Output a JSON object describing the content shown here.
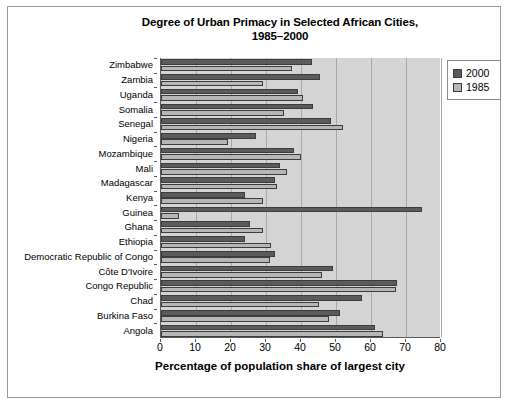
{
  "chart_data": {
    "type": "bar",
    "orientation": "horizontal",
    "title": "Degree of Urban Primacy in Selected African Cities, 1985–2000",
    "title_line1": "Degree of Urban Primacy in Selected African Cities,",
    "title_line2": "1985–2000",
    "xlabel": "Percentage of population share of largest city",
    "ylabel": "",
    "xlim": [
      0,
      80
    ],
    "xticks": [
      0,
      10,
      20,
      30,
      40,
      50,
      60,
      70,
      80
    ],
    "xtick_labels": [
      "0",
      "10",
      "20",
      "30",
      "40",
      "50",
      "60",
      "70",
      "80"
    ],
    "grid": true,
    "grid_axis": "x",
    "legend_position": "top-right",
    "categories": [
      "Zimbabwe",
      "Zambia",
      "Uganda",
      "Somalia",
      "Senegal",
      "Nigeria",
      "Mozambique",
      "Mali",
      "Madagascar",
      "Kenya",
      "Guinea",
      "Ghana",
      "Ethiopia",
      "Democratic Republic of Congo",
      "Côte D'Ivoire",
      "Congo Republic",
      "Chad",
      "Burkina Faso",
      "Angola"
    ],
    "series": [
      {
        "name": "2000",
        "color": "#5b5b5b",
        "values": [
          43,
          45.5,
          39,
          43.5,
          48.5,
          27,
          38,
          34,
          32.5,
          24,
          74.5,
          25.5,
          24,
          32.5,
          49,
          67.5,
          57.5,
          51,
          61
        ]
      },
      {
        "name": "1985",
        "color": "#b6b6b6",
        "values": [
          37.5,
          29,
          40.5,
          35,
          52,
          19,
          40,
          36,
          33,
          29,
          5,
          29,
          31.5,
          31,
          46,
          67,
          45,
          48,
          63.5
        ]
      }
    ]
  },
  "legend": {
    "items": [
      {
        "label": "2000",
        "color": "#5b5b5b"
      },
      {
        "label": "1985",
        "color": "#b6b6b6"
      }
    ]
  }
}
